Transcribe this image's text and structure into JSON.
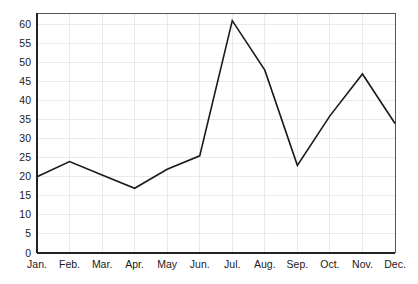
{
  "chart_data": {
    "type": "line",
    "title": "",
    "subtitle": "",
    "xlabel": "",
    "ylabel": "",
    "categories": [
      "Jan.",
      "Feb.",
      "Mar.",
      "Apr.",
      "May",
      "Jun.",
      "Jul.",
      "Aug.",
      "Sep.",
      "Oct.",
      "Nov.",
      "Dec."
    ],
    "values": [
      20,
      24,
      20.5,
      17,
      22,
      25.5,
      61,
      48,
      23,
      36,
      47,
      34
    ],
    "series": [
      {
        "name": "",
        "values": [
          20,
          24,
          20.5,
          17,
          22,
          25.5,
          61,
          48,
          23,
          36,
          47,
          34
        ]
      }
    ],
    "ylim": [
      0,
      63
    ],
    "y_ticks": [
      0,
      5,
      10,
      15,
      20,
      25,
      30,
      35,
      40,
      45,
      50,
      55,
      60
    ],
    "y_tick_labels": [
      "0",
      "5",
      "10",
      "15",
      "20",
      "25",
      "30",
      "35",
      "40",
      "45",
      "50",
      "55",
      "60"
    ],
    "x_tick_labels": [
      "Jan.",
      "Feb.",
      "Mar.",
      "Apr.",
      "May",
      "Jun.",
      "Jul.",
      "Aug.",
      "Sep.",
      "Oct.",
      "Nov.",
      "Dec."
    ],
    "grid": true,
    "grid_color": "#e8e8ee",
    "legend": false,
    "legend_position": "none",
    "line_color": "#1a1a1a",
    "background_color": "#ffffff",
    "annotations": []
  },
  "plot": {
    "left": 37,
    "right": 395,
    "top": 13,
    "bottom": 253
  }
}
